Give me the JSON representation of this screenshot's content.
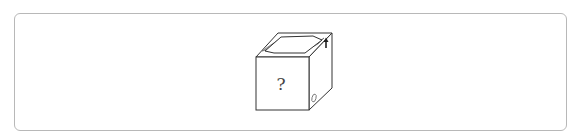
{
  "figure": {
    "type": "cube-puzzle",
    "front_face_label": "?",
    "top_face_pattern": "hexagon-opening-with-gray-wedges",
    "right_face_top_symbol": "up-arrow",
    "right_face_bottom_symbol": "zero-like-oval",
    "colors": {
      "border": "#b8b8b8",
      "edge": "#333333",
      "wedge_fill": "#bdbdbd",
      "face_fill": "#ffffff"
    }
  }
}
